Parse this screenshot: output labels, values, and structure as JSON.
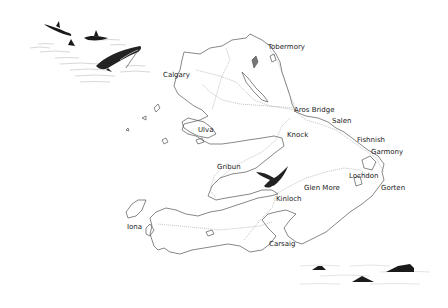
{
  "map": {
    "subject": "Isle of Mull illustrated map",
    "colors": {
      "background": "#ffffff",
      "coastline": "#555555",
      "roads": "#888888",
      "label": "#222222",
      "animals": "#1a1a1a"
    },
    "labels": [
      {
        "id": "tobermory",
        "text": "Tobermory",
        "x": 268,
        "y": 47
      },
      {
        "id": "calgary",
        "text": "Calgary",
        "x": 163,
        "y": 72
      },
      {
        "id": "aros-bridge",
        "text": "Aros Bridge",
        "x": 294,
        "y": 107
      },
      {
        "id": "salen",
        "text": "Salen",
        "x": 332,
        "y": 118
      },
      {
        "id": "knock",
        "text": "Knock",
        "x": 287,
        "y": 131
      },
      {
        "id": "ulva",
        "text": "Ulva",
        "x": 198,
        "y": 127
      },
      {
        "id": "fishnish",
        "text": "Fishnish",
        "x": 357,
        "y": 136
      },
      {
        "id": "garmony",
        "text": "Garmony",
        "x": 371,
        "y": 148
      },
      {
        "id": "gribun",
        "text": "Gribun",
        "x": 217,
        "y": 164
      },
      {
        "id": "lochdon",
        "text": "Lochdon",
        "x": 349,
        "y": 173
      },
      {
        "id": "glen-more",
        "text": "Glen More",
        "x": 304,
        "y": 184
      },
      {
        "id": "gorten",
        "text": "Gorten",
        "x": 381,
        "y": 184
      },
      {
        "id": "kinloch",
        "text": "Kinloch",
        "x": 276,
        "y": 195
      },
      {
        "id": "iona",
        "text": "Iona",
        "x": 127,
        "y": 226
      },
      {
        "id": "carsaig",
        "text": "Carsaig",
        "x": 269,
        "y": 242
      }
    ],
    "illustrations": [
      {
        "id": "dolphins",
        "description": "Leaping dolphins",
        "position": "top-left"
      },
      {
        "id": "eagle",
        "description": "Soaring eagle",
        "position": "center"
      },
      {
        "id": "porpoises",
        "description": "Porpoise fins",
        "position": "bottom-right"
      }
    ]
  }
}
